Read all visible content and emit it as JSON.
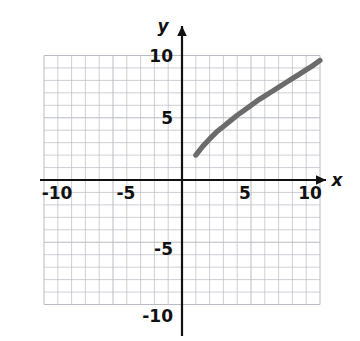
{
  "figure": {
    "kind": "cartesian-coordinate-plane",
    "background_color": "#ffffff",
    "grid_color": "#b9bcc4",
    "axis_color": "#111111",
    "curve_color": "#6b6b6b",
    "tick_label_color": "#111111"
  },
  "axes": {
    "x_axis_label": "x",
    "y_axis_label": "y",
    "x_ticks": [
      "-10",
      "-5",
      "5",
      "10"
    ],
    "y_ticks": [
      "10",
      "5",
      "-5",
      "-10"
    ],
    "x_tick_values": [
      -10,
      -5,
      5,
      10
    ],
    "y_tick_values": [
      10,
      5,
      -5,
      -10
    ],
    "xlim": [
      -10,
      10
    ],
    "ylim": [
      -10,
      10
    ],
    "grid": true,
    "minor_grid_step": 1,
    "major_grid_step": 5,
    "arrow_on_positive_x": true,
    "arrow_on_positive_y": true
  },
  "chart_data": {
    "type": "line",
    "title": "",
    "xlabel": "x",
    "ylabel": "y",
    "xlim": [
      -10,
      10
    ],
    "ylim": [
      -10,
      10
    ],
    "grid": true,
    "legend": "none",
    "series": [
      {
        "name": "curve",
        "color": "#6b6b6b",
        "shape": "increasing concave-down square-root curve",
        "domain": [
          1,
          10
        ],
        "x": [
          1,
          1.5,
          2,
          2.5,
          3,
          3.5,
          4,
          4.5,
          5,
          5.5,
          6,
          6.5,
          7,
          7.5,
          8,
          8.5,
          9,
          9.5,
          10
        ],
        "y": [
          2.0,
          2.7,
          3.3,
          3.85,
          4.3,
          4.75,
          5.2,
          5.6,
          6.0,
          6.4,
          6.75,
          7.1,
          7.45,
          7.8,
          8.15,
          8.5,
          8.85,
          9.2,
          9.6
        ],
        "endpoints": {
          "start": [
            1,
            2
          ],
          "end": [
            10,
            9.6
          ]
        }
      }
    ]
  }
}
